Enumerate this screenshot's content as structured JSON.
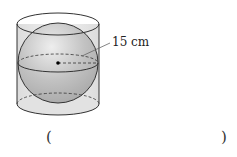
{
  "figure": {
    "radius_label": "15 cm",
    "colors": {
      "cylinder_fill": "#ebebeb",
      "sphere_fill": "#b8b8b8",
      "stroke": "#333333"
    }
  },
  "answer": {
    "open_paren": "(",
    "close_paren": ")",
    "value": ""
  }
}
